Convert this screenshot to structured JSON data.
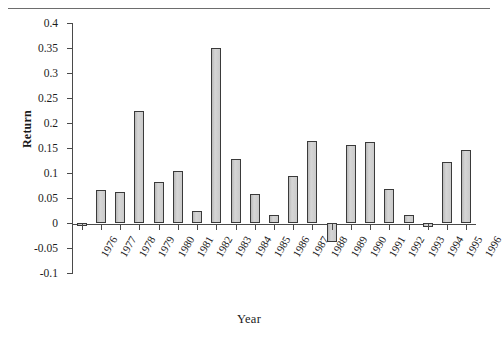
{
  "figure": {
    "has_top_rule": true,
    "background": "#ffffff",
    "bar_fill": "#c9c9c9",
    "bar_edge": "#3a3a3a",
    "axis_color": "#4a4a4a"
  },
  "chart_data": {
    "type": "bar",
    "title": "",
    "subtitle": "",
    "xlabel": "Year",
    "ylabel": "Return",
    "ylim": [
      -0.1,
      0.4
    ],
    "yticks": [
      0.4,
      0.35,
      0.3,
      0.25,
      0.2,
      0.15,
      0.1,
      0.05,
      0,
      -0.05,
      -0.1
    ],
    "ytick_labels": [
      "0.4",
      "0.35",
      "0.3",
      "0.25",
      "0.2",
      "0.15",
      "0.1",
      "0.05",
      "0",
      "-0.05",
      "-0.1"
    ],
    "grid": false,
    "legend": null,
    "categories": [
      "1976",
      "1977",
      "1978",
      "1979",
      "1980",
      "1981",
      "1982",
      "1983",
      "1984",
      "1985",
      "1986",
      "1987",
      "1988",
      "1989",
      "1990",
      "1991",
      "1992",
      "1993",
      "1994",
      "1995",
      "1996"
    ],
    "values": [
      -0.004,
      0.066,
      0.062,
      0.224,
      0.083,
      0.104,
      0.025,
      0.351,
      0.129,
      0.058,
      0.016,
      0.095,
      0.165,
      -0.038,
      0.156,
      0.162,
      0.068,
      0.017,
      -0.008,
      0.123,
      0.147
    ]
  }
}
